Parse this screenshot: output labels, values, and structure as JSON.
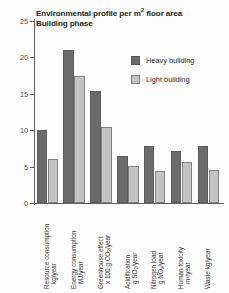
{
  "chart_data": {
    "type": "bar",
    "subtitle": "Building phase",
    "xlabel": "",
    "ylabel": "",
    "ylim": [
      0,
      25
    ],
    "yticks": [
      "0",
      "5",
      "10",
      "15",
      "20",
      "25"
    ],
    "grid": false,
    "legend_position": "top-right",
    "categories": [
      "Resource consumption kg/year",
      "Energy consumption MJ/year",
      "Greenhouse effect x 100 g CO2/year",
      "Acidification g SO2/year",
      "Nitrogen load g NOx/year",
      "Human toxicity m³/year",
      "Waste kg/year"
    ],
    "category_lines": [
      {
        "line1": "Resource consumption",
        "line2": "kg/year"
      },
      {
        "line1": "Energy consumption",
        "line2": "MJ/year"
      },
      {
        "line1": "Greenhouse effect",
        "line2": "x 100 g CO₂/year"
      },
      {
        "line1": "Acidification",
        "line2": "g SO₂/year"
      },
      {
        "line1": "Nitrogen load",
        "line2": "g NOₓ/year"
      },
      {
        "line1": "Human toxicity",
        "line2": "m³/year"
      },
      {
        "line1": "Waste kg/year",
        "line2": ""
      }
    ],
    "series": [
      {
        "name": "Heavy building",
        "color": "#6b6b6b",
        "values": [
          10.0,
          21.0,
          15.4,
          6.5,
          7.9,
          7.2,
          7.9
        ]
      },
      {
        "name": "Light building",
        "color": "#c3c3c3",
        "values": [
          6.0,
          17.5,
          10.4,
          5.1,
          4.4,
          5.7,
          4.5
        ]
      }
    ]
  },
  "legend": {
    "items": [
      {
        "label": "Heavy building",
        "swatch": "heavy"
      },
      {
        "label": "Light building",
        "swatch": "light"
      }
    ]
  }
}
